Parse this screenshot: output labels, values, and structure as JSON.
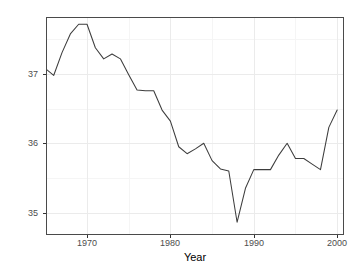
{
  "chart_data": {
    "type": "line",
    "title": "",
    "xlabel": "Year",
    "ylabel": "Hours per week",
    "xlim": [
      1965.2,
      2000.7
    ],
    "ylim": [
      34.69,
      37.81
    ],
    "xticks": [
      1970,
      1980,
      1990,
      2000
    ],
    "xtick_labels": [
      "1970",
      "1980",
      "1990",
      "2000"
    ],
    "yticks": [
      35,
      36,
      37
    ],
    "ytick_labels": [
      "35",
      "36",
      "37"
    ],
    "grid": true,
    "grid_minor": true,
    "legend": "none",
    "x": [
      1965,
      1966,
      1967,
      1968,
      1969,
      1970,
      1971,
      1972,
      1973,
      1974,
      1975,
      1976,
      1977,
      1978,
      1979,
      1980,
      1981,
      1982,
      1983,
      1984,
      1985,
      1986,
      1987,
      1988,
      1989,
      1990,
      1991,
      1992,
      1993,
      1994,
      1995,
      1996,
      1997,
      1998,
      1999,
      2000
    ],
    "y": [
      37.08,
      36.98,
      37.31,
      37.58,
      37.72,
      37.72,
      37.38,
      37.22,
      37.29,
      37.22,
      36.99,
      36.77,
      36.76,
      36.76,
      36.48,
      36.32,
      35.95,
      35.85,
      35.92,
      36.0,
      35.75,
      35.63,
      35.6,
      34.86,
      35.35,
      35.62,
      35.62,
      35.62,
      35.83,
      36.0,
      35.78,
      35.78,
      35.7,
      35.62,
      36.23,
      36.48
    ],
    "series_name": "Hours per week",
    "line_color": "#3d3d3d",
    "panel_background": "#ffffff",
    "grid_color": "#ebebeb",
    "grid_minor_color": "#f5f5f5",
    "border_color": "#4a4a4a",
    "tick_label_color": "#4d4d4d",
    "axis_title_color": "#000000"
  }
}
